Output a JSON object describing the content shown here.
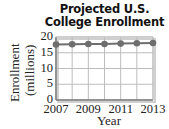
{
  "chart_data": {
    "type": "line",
    "title": "Projected U.S. College Enrollment",
    "title_lines": [
      "Projected U.S.",
      "College Enrollment"
    ],
    "xlabel": "Year",
    "ylabel": "Enrollment (millions)",
    "ylabel_lines": [
      "Enrollment",
      "(millions)"
    ],
    "x": [
      2007,
      2008,
      2009,
      2010,
      2011,
      2012,
      2013
    ],
    "series": [
      {
        "name": "Projected enrollment",
        "values": [
          17.6,
          17.7,
          17.8,
          17.8,
          17.9,
          18.0,
          18.1
        ]
      }
    ],
    "xticks": [
      "2007",
      "2009",
      "2011",
      "2013"
    ],
    "yticks": [
      "0",
      "5",
      "10",
      "15",
      "20"
    ],
    "ylim": [
      0,
      20
    ],
    "xlim": [
      2007,
      2013
    ],
    "grid": true,
    "legend": "none",
    "colors": {
      "line": "#6e6e6e",
      "marker": "#6e6e6e",
      "grid": "#bdbdbd",
      "axis": "#7a7a7a",
      "frame_shadow": "#d0d0d0"
    }
  }
}
